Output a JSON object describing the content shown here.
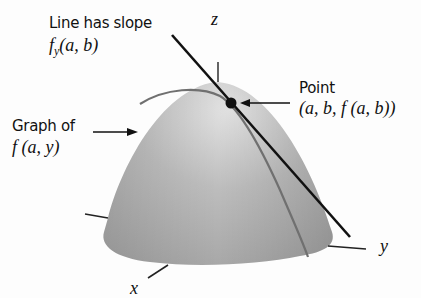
{
  "labels": {
    "slope_title": "Line has slope",
    "slope_expr_f": "f",
    "slope_expr_sub": "y",
    "slope_expr_args": "(a, b)",
    "z_axis": "z",
    "point_title": "Point",
    "point_expr": "(a, b, f (a, b))",
    "graph_title": "Graph of",
    "graph_expr": "f (a, y)",
    "x_axis": "x",
    "y_axis": "y"
  },
  "colors": {
    "surface_light": "#d8d8d8",
    "surface_mid": "#b4b4b4",
    "surface_dark": "#9a9a9a",
    "curve": "#6e6e6e",
    "line": "#111111",
    "point": "#111111"
  }
}
